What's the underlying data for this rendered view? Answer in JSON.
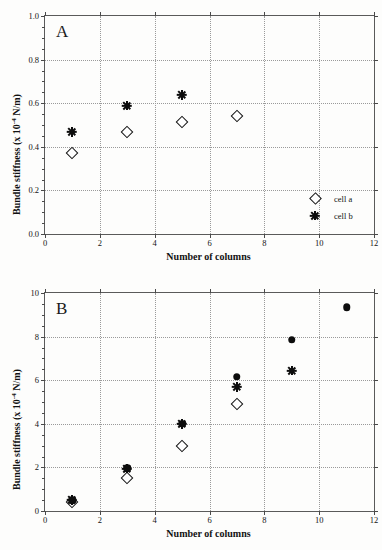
{
  "figure": {
    "panels": [
      {
        "id": "A",
        "letter": "A",
        "xlabel": "Number of columns",
        "ylabel": "Bundle stiffness (x 10 -4 N/m)",
        "ylabel_parts": {
          "pre": "Bundle stiffness (x 10",
          "sup": "-4",
          "post": " N/m)"
        },
        "xticks": [
          "0",
          "2",
          "4",
          "6",
          "8",
          "10",
          "12"
        ],
        "yticks": [
          "0.0",
          "0.2",
          "0.4",
          "0.6",
          "0.8",
          "1.0"
        ],
        "legend": [
          {
            "label": "cell a",
            "marker": "open-diamond"
          },
          {
            "label": "cell b",
            "marker": "asterisk"
          }
        ]
      },
      {
        "id": "B",
        "letter": "B",
        "xlabel": "Number of columns",
        "ylabel": "Bundle stiffness (x 10 -4 N/m)",
        "ylabel_parts": {
          "pre": "Bundle stiffness (x 10",
          "sup": "-4",
          "post": " N/m)"
        },
        "xticks": [
          "0",
          "2",
          "4",
          "6",
          "8",
          "10",
          "12"
        ],
        "yticks": [
          "0",
          "2",
          "4",
          "6",
          "8",
          "10"
        ],
        "legend": [
          {
            "label": "cell a",
            "marker": "open-diamond"
          },
          {
            "label": "cell b",
            "marker": "asterisk"
          },
          {
            "label": "cell c",
            "marker": "filled-circle"
          }
        ]
      }
    ]
  },
  "chart_data": [
    {
      "type": "scatter",
      "panel": "A",
      "title": "A",
      "xlabel": "Number of columns",
      "ylabel": "Bundle stiffness (x 10^-4 N/m)",
      "xlim": [
        0,
        12
      ],
      "ylim": [
        0.0,
        1.0
      ],
      "xticks": [
        0,
        2,
        4,
        6,
        8,
        10,
        12
      ],
      "yticks": [
        0.0,
        0.2,
        0.4,
        0.6,
        0.8,
        1.0
      ],
      "grid": true,
      "legend_position": "bottom-right",
      "series": [
        {
          "name": "cell a",
          "marker": "open-diamond",
          "color": "#111111",
          "x": [
            1,
            3,
            5,
            7
          ],
          "y": [
            0.373,
            0.468,
            0.515,
            0.541
          ]
        },
        {
          "name": "cell b",
          "marker": "asterisk",
          "color": "#0d0d0d",
          "x": [
            1,
            3,
            5
          ],
          "y": [
            0.468,
            0.59,
            0.637
          ]
        }
      ]
    },
    {
      "type": "scatter",
      "panel": "B",
      "title": "B",
      "xlabel": "Number of columns",
      "ylabel": "Bundle stiffness (x 10^-4 N/m)",
      "xlim": [
        0,
        12
      ],
      "ylim": [
        0,
        10
      ],
      "xticks": [
        0,
        2,
        4,
        6,
        8,
        10,
        12
      ],
      "yticks": [
        0,
        2,
        4,
        6,
        8,
        10
      ],
      "grid": true,
      "legend_position": "bottom-right",
      "series": [
        {
          "name": "cell a",
          "marker": "open-diamond",
          "color": "#111111",
          "x": [
            1,
            3,
            5,
            7
          ],
          "y": [
            0.4,
            1.5,
            3.0,
            4.9
          ]
        },
        {
          "name": "cell b",
          "marker": "asterisk",
          "color": "#0d0d0d",
          "x": [
            1,
            3,
            5,
            7,
            9
          ],
          "y": [
            0.5,
            1.95,
            4.0,
            5.7,
            6.45
          ]
        },
        {
          "name": "cell c",
          "marker": "filled-circle",
          "color": "#0d0d0d",
          "x": [
            1,
            3,
            5,
            7,
            9,
            11
          ],
          "y": [
            0.5,
            1.95,
            4.0,
            6.15,
            7.85,
            9.35
          ]
        }
      ]
    }
  ]
}
